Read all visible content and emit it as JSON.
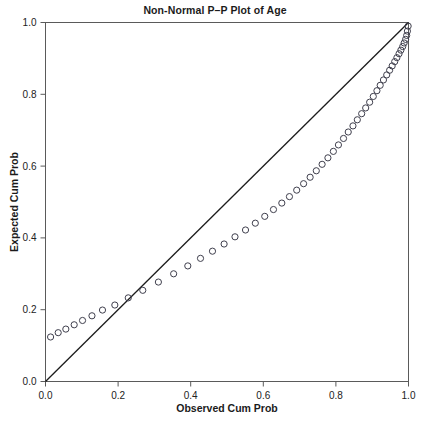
{
  "chart_data": {
    "type": "scatter",
    "title": "Non-Normal P–P Plot of Age",
    "xlabel": "Observed Cum Prob",
    "ylabel": "Expected Cum Prob",
    "xlim": [
      0.0,
      1.0
    ],
    "ylim": [
      0.0,
      1.0
    ],
    "xticks": [
      0.0,
      0.2,
      0.4,
      0.6,
      0.8,
      1.0
    ],
    "yticks": [
      0.0,
      0.2,
      0.4,
      0.6,
      0.8,
      1.0
    ],
    "xticklabels": [
      "0.0",
      "0.2",
      "0.4",
      "0.6",
      "0.8",
      "1.0"
    ],
    "yticklabels": [
      "0.0",
      "0.2",
      "0.4",
      "0.6",
      "0.8",
      "1.0"
    ],
    "grid": false,
    "legend": false,
    "marker": "open-circle",
    "marker_color": "#3f3f4d",
    "reference_line": {
      "label": "diagonal reference line",
      "color": "#1c1c1c",
      "from": [
        0.0,
        0.0
      ],
      "to": [
        1.0,
        1.0
      ]
    },
    "series": [
      {
        "name": "Age",
        "x": [
          0.014,
          0.035,
          0.056,
          0.079,
          0.102,
          0.128,
          0.157,
          0.191,
          0.228,
          0.268,
          0.311,
          0.353,
          0.392,
          0.427,
          0.46,
          0.492,
          0.522,
          0.551,
          0.578,
          0.604,
          0.628,
          0.651,
          0.672,
          0.692,
          0.711,
          0.729,
          0.746,
          0.762,
          0.778,
          0.793,
          0.807,
          0.821,
          0.834,
          0.847,
          0.859,
          0.871,
          0.882,
          0.893,
          0.903,
          0.913,
          0.922,
          0.931,
          0.94,
          0.948,
          0.955,
          0.962,
          0.968,
          0.974,
          0.979,
          0.984,
          0.988,
          0.992,
          0.995,
          0.997,
          0.999
        ],
        "y": [
          0.124,
          0.136,
          0.146,
          0.158,
          0.17,
          0.183,
          0.199,
          0.213,
          0.233,
          0.254,
          0.277,
          0.3,
          0.322,
          0.343,
          0.363,
          0.383,
          0.403,
          0.422,
          0.441,
          0.46,
          0.479,
          0.497,
          0.515,
          0.533,
          0.551,
          0.569,
          0.587,
          0.605,
          0.623,
          0.641,
          0.659,
          0.677,
          0.695,
          0.712,
          0.729,
          0.746,
          0.762,
          0.778,
          0.794,
          0.81,
          0.825,
          0.84,
          0.854,
          0.867,
          0.879,
          0.891,
          0.902,
          0.913,
          0.923,
          0.933,
          0.943,
          0.953,
          0.964,
          0.976,
          0.99
        ]
      }
    ]
  }
}
